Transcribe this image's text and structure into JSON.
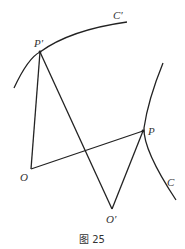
{
  "figure": {
    "caption": "图 25",
    "labels": {
      "P_prime": "P′",
      "C_prime": "C′",
      "P": "P",
      "C": "C",
      "O": "O",
      "O_prime": "O′"
    },
    "stroke_color": "#222222"
  }
}
